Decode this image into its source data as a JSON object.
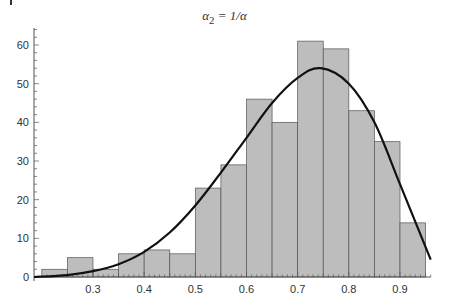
{
  "chart_data": {
    "type": "bar",
    "title_parts": {
      "base": "α",
      "sub": "2",
      "rhs": " = 1/α"
    },
    "xlabel": "",
    "ylabel": "",
    "bin_edges": [
      0.2,
      0.25,
      0.3,
      0.35,
      0.4,
      0.45,
      0.5,
      0.55,
      0.6,
      0.65,
      0.7,
      0.75,
      0.8,
      0.85,
      0.9,
      0.95
    ],
    "values": [
      2,
      5,
      2,
      6,
      7,
      6,
      23,
      29,
      46,
      40,
      61,
      59,
      43,
      35,
      14
    ],
    "xlim": [
      0.2,
      0.96
    ],
    "ylim": [
      0,
      65
    ],
    "x_ticks": [
      0.3,
      0.4,
      0.5,
      0.6,
      0.7,
      0.8,
      0.9
    ],
    "x_tick_labels": [
      "0.3",
      "0.4",
      "0.5",
      "0.6",
      "0.7",
      "0.8",
      "0.9"
    ],
    "y_ticks": [
      0,
      10,
      20,
      30,
      40,
      50,
      60
    ],
    "y_tick_labels": [
      "0",
      "10",
      "20",
      "30",
      "40",
      "50",
      "60"
    ],
    "grid": false,
    "legend": null,
    "overlay_curve": {
      "type": "line",
      "description": "fitted density curve",
      "x": [
        0.2,
        0.25,
        0.3,
        0.35,
        0.4,
        0.45,
        0.5,
        0.55,
        0.6,
        0.65,
        0.7,
        0.745,
        0.8,
        0.85,
        0.9,
        0.96
      ],
      "y": [
        0,
        0.5,
        1.5,
        3.3,
        6.5,
        11.5,
        18.5,
        27,
        36,
        45,
        51.5,
        54,
        50,
        40,
        24,
        4.5
      ]
    },
    "colors": {
      "bar_fill": "#bdbdbd",
      "bar_edge": "#555555",
      "curve": "#111111",
      "axis": "#555555",
      "text": "#333333"
    }
  }
}
